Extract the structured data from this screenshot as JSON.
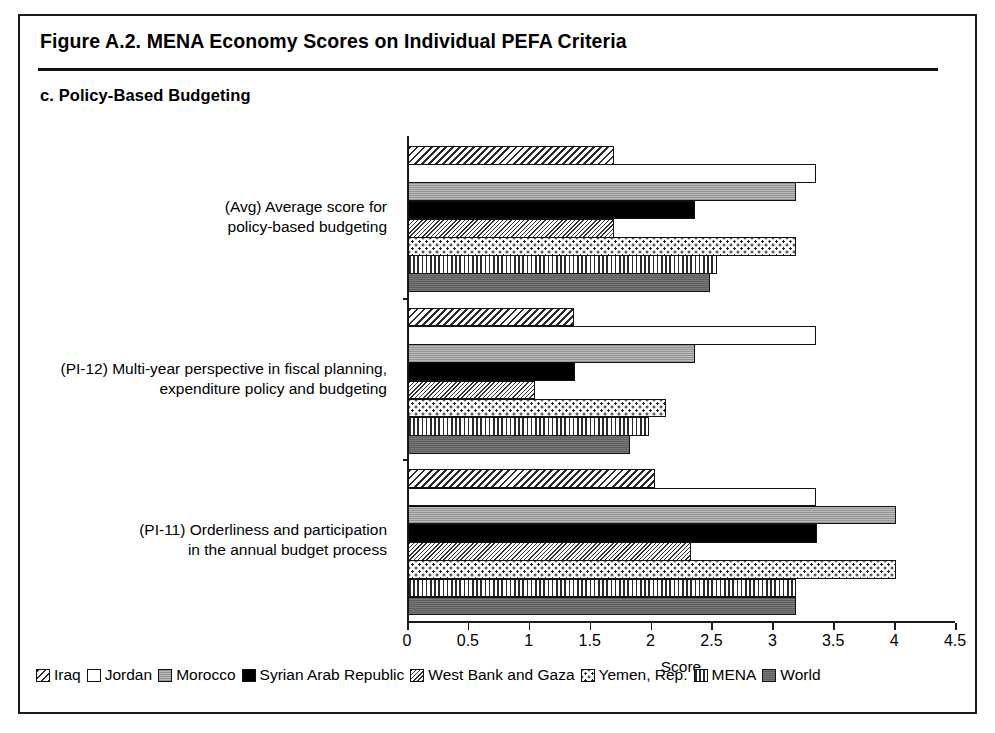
{
  "figure": {
    "title": "Figure A.2. MENA Economy Scores on Individual PEFA Criteria",
    "panel_title": "c. Policy-Based Budgeting"
  },
  "chart_data": {
    "type": "bar",
    "orientation": "horizontal",
    "title": "c. Policy-Based Budgeting",
    "xlabel": "Score",
    "ylabel": "",
    "xlim": [
      0,
      4.5
    ],
    "xticks": [
      "0",
      "0.5",
      "1",
      "1.5",
      "2",
      "2.5",
      "3",
      "3.5",
      "4",
      "4.5"
    ],
    "xtick_values": [
      0,
      0.5,
      1,
      1.5,
      2,
      2.5,
      3,
      3.5,
      4,
      4.5
    ],
    "grid": false,
    "legend_position": "bottom",
    "categories": [
      "(PI-11) Orderliness and participation in the annual budget process",
      "(PI-12) Multi-year perspective in fiscal planning, expenditure policy and budgeting",
      "(Avg) Average score for policy-based budgeting"
    ],
    "category_lines": [
      [
        "(PI-11) Orderliness and participation",
        "in the annual budget process"
      ],
      [
        "(PI-12) Multi-year perspective in fiscal planning,",
        "expenditure policy and budgeting"
      ],
      [
        "(Avg) Average score for",
        "policy-based budgeting"
      ]
    ],
    "series": [
      {
        "name": "Iraq",
        "pattern": "diagonal-hatch-wide",
        "values": [
          2.03,
          1.36,
          1.69
        ]
      },
      {
        "name": "Jordan",
        "pattern": "white-open",
        "values": [
          3.35,
          3.35,
          3.35
        ]
      },
      {
        "name": "Morocco",
        "pattern": "light-gray-solid",
        "values": [
          4.01,
          2.36,
          3.19
        ]
      },
      {
        "name": "Syrian Arab Republic",
        "pattern": "black-solid",
        "values": [
          3.36,
          1.37,
          2.36
        ]
      },
      {
        "name": "West Bank and Gaza",
        "pattern": "diagonal-hatch-fine",
        "values": [
          2.32,
          1.04,
          1.69
        ]
      },
      {
        "name": "Yemen, Rep.",
        "pattern": "dotted-grid",
        "values": [
          4.01,
          2.12,
          3.19
        ]
      },
      {
        "name": "MENA",
        "pattern": "vertical-lines",
        "values": [
          3.19,
          1.98,
          2.54
        ]
      },
      {
        "name": "World",
        "pattern": "dark-gray-solid",
        "values": [
          3.19,
          1.82,
          2.48
        ]
      }
    ]
  },
  "legend": {
    "items": [
      {
        "label": "Iraq"
      },
      {
        "label": "Jordan"
      },
      {
        "label": "Morocco"
      },
      {
        "label": "Syrian Arab Republic"
      },
      {
        "label": "West Bank and Gaza"
      },
      {
        "label": "Yemen, Rep."
      },
      {
        "label": "MENA"
      },
      {
        "label": "World"
      }
    ]
  }
}
